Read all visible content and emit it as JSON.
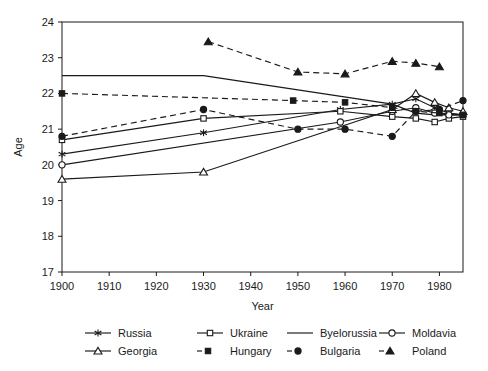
{
  "chart_data": {
    "type": "line",
    "title": "",
    "xlabel": "Year",
    "ylabel": "Age",
    "xlim": [
      1900,
      1985
    ],
    "ylim": [
      17,
      24
    ],
    "xticks": [
      1900,
      1910,
      1920,
      1930,
      1940,
      1950,
      1960,
      1970,
      1980
    ],
    "yticks": [
      17,
      18,
      19,
      20,
      21,
      22,
      23,
      24
    ],
    "grid": false,
    "legend_position": "bottom",
    "legend_columns": 4,
    "series": [
      {
        "name": "Russia",
        "marker": "asterisk",
        "line": "solid",
        "x": [
          1900,
          1930,
          1959,
          1970,
          1975,
          1979,
          1982,
          1985
        ],
        "values": [
          20.3,
          20.9,
          21.55,
          21.7,
          21.85,
          21.6,
          21.45,
          21.4
        ]
      },
      {
        "name": "Ukraine",
        "marker": "open-square",
        "line": "solid",
        "x": [
          1900,
          1930,
          1959,
          1970,
          1975,
          1979,
          1982,
          1985
        ],
        "values": [
          20.7,
          21.3,
          21.5,
          21.35,
          21.3,
          21.2,
          21.3,
          21.35
        ]
      },
      {
        "name": "Byelorussia",
        "marker": "none",
        "line": "solid",
        "x": [
          1900,
          1930,
          1970,
          1975,
          1979,
          1985
        ],
        "values": [
          22.5,
          22.5,
          21.7,
          21.45,
          21.4,
          21.4
        ]
      },
      {
        "name": "Moldavia",
        "marker": "open-circle",
        "line": "solid",
        "x": [
          1900,
          1959,
          1970,
          1975,
          1979,
          1982,
          1985
        ],
        "values": [
          20.0,
          21.2,
          21.5,
          21.6,
          21.45,
          21.4,
          21.4
        ]
      },
      {
        "name": "Georgia",
        "marker": "open-triangle",
        "line": "solid",
        "x": [
          1900,
          1930,
          1970,
          1975,
          1979,
          1982,
          1985
        ],
        "values": [
          19.6,
          19.8,
          21.55,
          22.0,
          21.75,
          21.6,
          21.5
        ]
      },
      {
        "name": "Hungary",
        "marker": "filled-square",
        "line": "dashed",
        "x": [
          1900,
          1949,
          1960,
          1970,
          1975,
          1980,
          1985
        ],
        "values": [
          22.0,
          21.8,
          21.75,
          21.6,
          21.5,
          21.45,
          21.4
        ]
      },
      {
        "name": "Bulgaria",
        "marker": "filled-circle",
        "line": "dashed",
        "x": [
          1900,
          1930,
          1950,
          1960,
          1970,
          1975,
          1980,
          1985
        ],
        "values": [
          20.8,
          21.55,
          21.0,
          21.0,
          20.8,
          21.5,
          21.55,
          21.8
        ]
      },
      {
        "name": "Poland",
        "marker": "filled-triangle",
        "line": "dashed",
        "x": [
          1931,
          1950,
          1960,
          1970,
          1975,
          1980
        ],
        "values": [
          23.45,
          22.6,
          22.55,
          22.9,
          22.85,
          22.75
        ]
      }
    ]
  },
  "legend": {
    "rows": [
      [
        "Russia",
        "Ukraine",
        "Byelorussia",
        "Moldavia"
      ],
      [
        "Georgia",
        "Hungary",
        "Bulgaria",
        "Poland"
      ]
    ]
  },
  "colors": {
    "ink": "#1a1a1a",
    "background": "#ffffff"
  }
}
